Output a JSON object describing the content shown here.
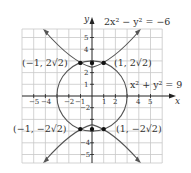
{
  "figure": {
    "x_axis_label": "x",
    "y_axis_label": "y",
    "x_ticks": [
      "−5",
      "−4",
      "−2",
      "−1",
      "1",
      "2",
      "4",
      "5"
    ],
    "y_ticks": [
      "5",
      "4",
      "2",
      "1",
      "−2",
      "−4",
      "−5"
    ],
    "equations": {
      "hyperbola": "2x² − y² = −6",
      "circle": "x² + y² = 9"
    },
    "points": [
      {
        "label": "(−1, 2√2)",
        "x": -1,
        "y": 2.828
      },
      {
        "label": "(1, 2√2)",
        "x": 1,
        "y": 2.828
      },
      {
        "label": "(−1, −2√2)",
        "x": -1,
        "y": -2.828
      },
      {
        "label": "(1, −2√2)",
        "x": 1,
        "y": -2.828
      }
    ],
    "colors": {
      "grid": "#c8c8c8",
      "curve": "#555555",
      "axis": "#222222",
      "point": "#111111"
    }
  }
}
